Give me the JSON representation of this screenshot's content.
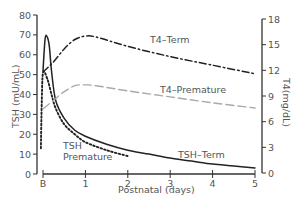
{
  "chart_data": {
    "type": "line",
    "title": "",
    "xlabel": "Postnatal (days)",
    "ylabel_left": "TSH (mU/mL)",
    "ylabel_right": "T4(mg/dL)",
    "x_ticks": [
      "B",
      "1",
      "2",
      "3",
      "4",
      "5"
    ],
    "y_left_ticks": [
      0,
      10,
      20,
      30,
      40,
      50,
      60,
      70,
      80
    ],
    "y_right_ticks": [
      0,
      3,
      6,
      9,
      12,
      15,
      18
    ],
    "ylim_left": [
      0,
      80
    ],
    "ylim_right": [
      0,
      18
    ],
    "xlim": [
      0,
      5
    ],
    "grid": false,
    "legend": "inline labels",
    "series": [
      {
        "name": "TSH-Term",
        "axis": "left",
        "style": "solid",
        "color": "#222222",
        "x": [
          0.0,
          0.05,
          0.1,
          0.15,
          0.2,
          0.3,
          0.5,
          0.75,
          1.0,
          1.5,
          2.0,
          2.5,
          3.0,
          3.5,
          4.0,
          4.5,
          5.0
        ],
        "values": [
          52,
          68,
          69,
          64,
          52,
          37,
          28,
          22,
          19,
          15,
          12,
          10,
          8,
          6.5,
          5,
          4,
          3
        ]
      },
      {
        "name": "TSH Premature",
        "axis": "left",
        "style": "dotted",
        "color": "#222222",
        "x": [
          -0.05,
          -0.03,
          0.0,
          0.1,
          0.2,
          0.3,
          0.5,
          0.75,
          1.0,
          1.5,
          2.0
        ],
        "values": [
          13,
          35,
          51,
          48,
          40,
          33,
          25,
          20,
          16,
          12,
          9
        ]
      },
      {
        "name": "T4-Term",
        "axis": "right",
        "style": "dash-dot",
        "color": "#222222",
        "x": [
          0.0,
          0.25,
          0.5,
          0.75,
          1.0,
          1.25,
          2.0,
          3.0,
          4.0,
          5.0
        ],
        "values": [
          11.8,
          13.0,
          14.5,
          15.6,
          16.0,
          15.9,
          14.8,
          13.6,
          12.6,
          11.6
        ]
      },
      {
        "name": "T4-Premature",
        "axis": "right",
        "style": "dashed",
        "color": "#aaaaaa",
        "x": [
          0.0,
          0.25,
          0.5,
          0.75,
          1.0,
          1.25,
          2.0,
          3.0,
          4.0,
          5.0
        ],
        "values": [
          7.5,
          8.5,
          9.5,
          10.2,
          10.3,
          10.2,
          9.6,
          8.9,
          8.2,
          7.6
        ]
      }
    ],
    "annotations": [
      {
        "text": "T4–Term",
        "series": "T4-Term"
      },
      {
        "text": "T4–Premature",
        "series": "T4-Premature"
      },
      {
        "text": "TSH",
        "series": "TSH Premature"
      },
      {
        "text": "Premature",
        "series": "TSH Premature"
      },
      {
        "text": "TSH–Term",
        "series": "TSH-Term"
      }
    ]
  },
  "labels": {
    "xlabel": "Postnatal (days)",
    "ylabel_left": "TSH (mU/mL)",
    "ylabel_right": "T4(mg/dL)",
    "t4_term": "T4–Term",
    "t4_premature": "T4–Premature",
    "tsh_premature_line1": "TSH",
    "tsh_premature_line2": "Premature",
    "tsh_term": "TSH–Term"
  }
}
